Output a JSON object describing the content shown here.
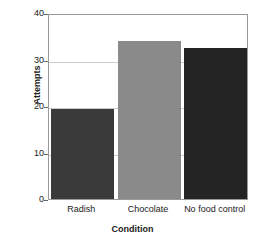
{
  "chart_data": {
    "type": "bar",
    "title": "",
    "xlabel": "Condition",
    "ylabel": "Attempts",
    "categories": [
      "Radish",
      "Chocolate",
      "No food control"
    ],
    "values": [
      19.3,
      34,
      32.5
    ],
    "bar_colors": [
      "#3a3a3a",
      "#8a8a8a",
      "#242424"
    ],
    "ylim": [
      0,
      40
    ],
    "yticks": [
      0,
      10,
      20,
      30,
      40
    ],
    "ytick_labels": [
      "0",
      "10",
      "20",
      "30",
      "40"
    ],
    "grid": true,
    "legend": "none",
    "axis_color": "#9a9a9a",
    "gridline_color": "#cccccc",
    "text_color": "#1a1a1a",
    "background": "#ffffff"
  }
}
